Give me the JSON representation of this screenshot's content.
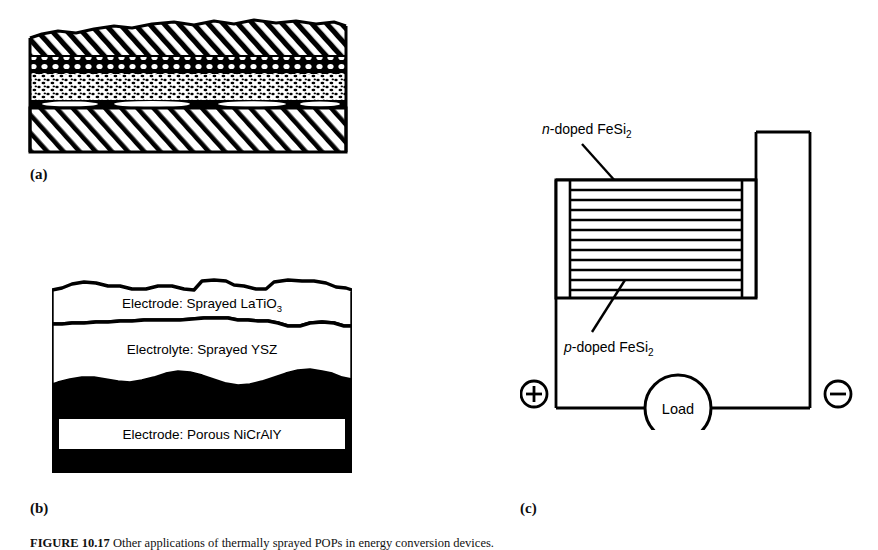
{
  "figure": {
    "caption_label": "FIGURE 10.17",
    "caption_text": "Other applications of thermally sprayed POPs in energy conversion devices."
  },
  "panels": [
    {
      "id": "a",
      "label": "(a)",
      "description": "Cross-section of a sprayed multilayer coating on a substrate",
      "layers": [
        {
          "name": "top-coat",
          "texture": "diagonal-hatch"
        },
        {
          "name": "coarse-porous-band",
          "texture": "open-circles"
        },
        {
          "name": "fine-porous-band",
          "texture": "stipple"
        },
        {
          "name": "bond-line",
          "texture": "solid-dark"
        },
        {
          "name": "substrate",
          "texture": "diagonal-hatch"
        }
      ]
    },
    {
      "id": "b",
      "label": "(b)",
      "description": "Sprayed solid oxide fuel cell layer stack",
      "layers": [
        {
          "name": "electrode-top",
          "text_prefix": "Electrode: Sprayed LaTiO",
          "subscript": "3"
        },
        {
          "name": "electrolyte",
          "text_prefix": "Electrolyte: Sprayed YSZ",
          "subscript": ""
        },
        {
          "name": "electrode-bottom",
          "text_prefix": "Electrode: Porous NiCrAlY",
          "subscript": ""
        }
      ]
    },
    {
      "id": "c",
      "label": "(c)",
      "description": "Thermoelectric generator module connected to a load",
      "annotations": [
        {
          "name": "n-doped",
          "italic": "n",
          "rest": "-doped FeSi",
          "subscript": "2"
        },
        {
          "name": "p-doped",
          "italic": "p",
          "rest": "-doped FeSi",
          "subscript": "2"
        }
      ],
      "circuit": {
        "load_label": "Load",
        "positive_terminal": "+",
        "negative_terminal": "−",
        "stripe_count": 11
      }
    }
  ],
  "colors": {
    "ink": "#000000",
    "background": "#ffffff",
    "caption_ink": "#111111"
  }
}
